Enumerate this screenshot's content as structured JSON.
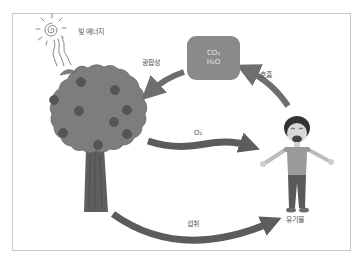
{
  "diagram": {
    "title_topic": "carbon / energy cycle between plant and human",
    "labels": {
      "light_energy": "빛 에너지",
      "photosynthesis": "광합성",
      "respiration": "호흡",
      "oxygen": "O₂",
      "intake": "섭취",
      "organic_matter": "유기물"
    },
    "box": {
      "line1": "CO₂",
      "line2": "H₂O"
    },
    "colors": {
      "arrow": "#6e6e6e",
      "tree_crown": "#7d7d7d",
      "tree_trunk": "#5a5a5a",
      "fruit": "#555555",
      "box_fill": "#8a8a8a",
      "frame": "#c9c9c9"
    },
    "nodes": [
      "sun",
      "tree",
      "co2-h2o-box",
      "person"
    ],
    "edges": [
      {
        "from": "sun",
        "to": "tree",
        "label": "빛 에너지"
      },
      {
        "from": "co2-h2o-box",
        "to": "tree",
        "label": "광합성"
      },
      {
        "from": "person",
        "to": "co2-h2o-box",
        "label": "호흡"
      },
      {
        "from": "tree",
        "to": "person",
        "label": "O₂"
      },
      {
        "from": "tree",
        "to": "person",
        "label": "섭취"
      }
    ]
  }
}
